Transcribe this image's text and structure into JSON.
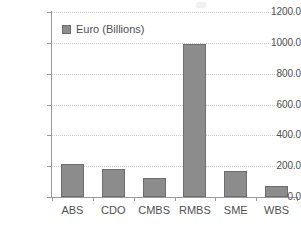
{
  "chart_data": {
    "type": "bar",
    "title": "",
    "subtitle": "",
    "xlabel": "",
    "ylabel": "",
    "categories": [
      "ABS",
      "CDO",
      "CMBS",
      "RMBS",
      "SME",
      "WBS"
    ],
    "series": [
      {
        "name": "Euro (Billions)",
        "color": "#8c8c8c",
        "values": [
          215,
          180,
          125,
          995,
          170,
          70
        ]
      }
    ],
    "values": [
      215,
      180,
      125,
      995,
      170,
      70
    ],
    "ylim": [
      0,
      1200
    ],
    "ytick_values": [
      0,
      200,
      400,
      600,
      800,
      1000,
      1200
    ],
    "ytick_labels": [
      "0.0",
      "200.0",
      "400.0",
      "600.0",
      "800.0",
      "1000.0",
      "1200.0"
    ],
    "ytick_step": 200,
    "grid": true,
    "grid_axis": "y",
    "grid_style": "dotted",
    "grid_color": "#c9c9c9",
    "legend": {
      "show": true,
      "position": "inside-top-left",
      "entries": [
        {
          "label": "Euro (Billions)",
          "swatch_color": "#8c8c8c"
        }
      ]
    },
    "axis_color": "#9a9a9a",
    "bar_fill": "#8c8c8c",
    "bar_border": "#6d6d6d",
    "background": "#ffffff"
  }
}
